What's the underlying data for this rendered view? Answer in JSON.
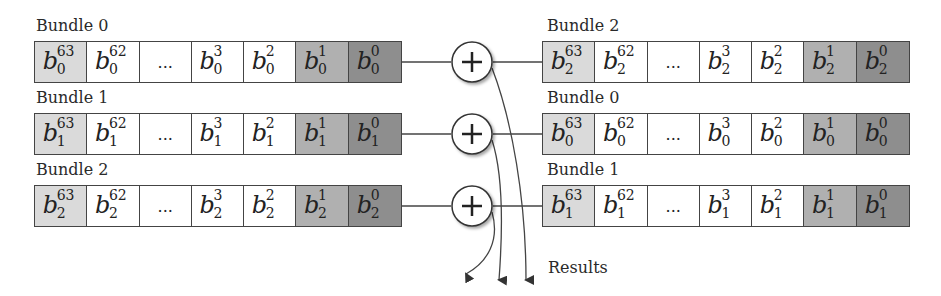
{
  "diagram": {
    "type": "bundle-addition",
    "left_bundles": [
      {
        "label": "Bundle 0",
        "index": "0",
        "cells": [
          {
            "base": "b",
            "sup": "63",
            "sub": "0",
            "shade": "light"
          },
          {
            "base": "b",
            "sup": "62",
            "sub": "0",
            "shade": "white"
          },
          {
            "text": "...",
            "shade": "white"
          },
          {
            "base": "b",
            "sup": "3",
            "sub": "0",
            "shade": "white"
          },
          {
            "base": "b",
            "sup": "2",
            "sub": "0",
            "shade": "white"
          },
          {
            "base": "b",
            "sup": "1",
            "sub": "0",
            "shade": "mid"
          },
          {
            "base": "b",
            "sup": "0",
            "sub": "0",
            "shade": "dark"
          }
        ]
      },
      {
        "label": "Bundle 1",
        "index": "1",
        "cells": [
          {
            "base": "b",
            "sup": "63",
            "sub": "1",
            "shade": "light"
          },
          {
            "base": "b",
            "sup": "62",
            "sub": "1",
            "shade": "white"
          },
          {
            "text": "...",
            "shade": "white"
          },
          {
            "base": "b",
            "sup": "3",
            "sub": "1",
            "shade": "white"
          },
          {
            "base": "b",
            "sup": "2",
            "sub": "1",
            "shade": "white"
          },
          {
            "base": "b",
            "sup": "1",
            "sub": "1",
            "shade": "mid"
          },
          {
            "base": "b",
            "sup": "0",
            "sub": "1",
            "shade": "dark"
          }
        ]
      },
      {
        "label": "Bundle 2",
        "index": "2",
        "cells": [
          {
            "base": "b",
            "sup": "63",
            "sub": "2",
            "shade": "light"
          },
          {
            "base": "b",
            "sup": "62",
            "sub": "2",
            "shade": "white"
          },
          {
            "text": "...",
            "shade": "white"
          },
          {
            "base": "b",
            "sup": "3",
            "sub": "2",
            "shade": "white"
          },
          {
            "base": "b",
            "sup": "2",
            "sub": "2",
            "shade": "white"
          },
          {
            "base": "b",
            "sup": "1",
            "sub": "2",
            "shade": "mid"
          },
          {
            "base": "b",
            "sup": "0",
            "sub": "2",
            "shade": "dark"
          }
        ]
      }
    ],
    "right_bundles": [
      {
        "label": "Bundle 2",
        "index": "2",
        "cells": [
          {
            "base": "b",
            "sup": "63",
            "sub": "2",
            "shade": "light"
          },
          {
            "base": "b",
            "sup": "62",
            "sub": "2",
            "shade": "white"
          },
          {
            "text": "...",
            "shade": "white"
          },
          {
            "base": "b",
            "sup": "3",
            "sub": "2",
            "shade": "white"
          },
          {
            "base": "b",
            "sup": "2",
            "sub": "2",
            "shade": "white"
          },
          {
            "base": "b",
            "sup": "1",
            "sub": "2",
            "shade": "mid"
          },
          {
            "base": "b",
            "sup": "0",
            "sub": "2",
            "shade": "dark"
          }
        ]
      },
      {
        "label": "Bundle 0",
        "index": "0",
        "cells": [
          {
            "base": "b",
            "sup": "63",
            "sub": "0",
            "shade": "light"
          },
          {
            "base": "b",
            "sup": "62",
            "sub": "0",
            "shade": "white"
          },
          {
            "text": "...",
            "shade": "white"
          },
          {
            "base": "b",
            "sup": "3",
            "sub": "0",
            "shade": "white"
          },
          {
            "base": "b",
            "sup": "2",
            "sub": "0",
            "shade": "white"
          },
          {
            "base": "b",
            "sup": "1",
            "sub": "0",
            "shade": "mid"
          },
          {
            "base": "b",
            "sup": "0",
            "sub": "0",
            "shade": "dark"
          }
        ]
      },
      {
        "label": "Bundle 1",
        "index": "1",
        "cells": [
          {
            "base": "b",
            "sup": "63",
            "sub": "1",
            "shade": "light"
          },
          {
            "base": "b",
            "sup": "62",
            "sub": "1",
            "shade": "white"
          },
          {
            "text": "...",
            "shade": "white"
          },
          {
            "base": "b",
            "sup": "3",
            "sub": "1",
            "shade": "white"
          },
          {
            "base": "b",
            "sup": "2",
            "sub": "1",
            "shade": "white"
          },
          {
            "base": "b",
            "sup": "1",
            "sub": "1",
            "shade": "mid"
          },
          {
            "base": "b",
            "sup": "0",
            "sub": "1",
            "shade": "dark"
          }
        ]
      }
    ],
    "operators": [
      "+",
      "+",
      "+"
    ],
    "results_label": "Results",
    "colors": {
      "light": "#dadada",
      "white": "#ffffff",
      "mid": "#b0b0b0",
      "dark": "#8e8e8e",
      "stroke": "#444444"
    }
  }
}
